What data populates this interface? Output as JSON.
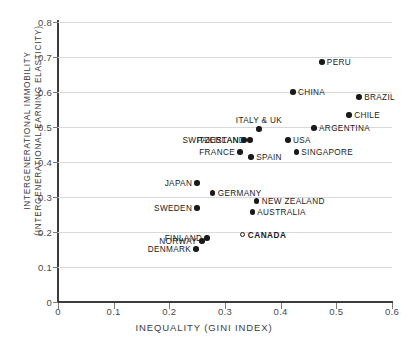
{
  "chart_data": {
    "type": "scatter",
    "title": "",
    "xlabel": "INEQUALITY (GINI INDEX)",
    "ylabel_line1": "INTERGENERATIONAL IMMOBILITY",
    "ylabel_line2": "(INTERGENERATIONAL EARNING ELASTICITY)",
    "xlim": [
      0,
      0.6
    ],
    "ylim": [
      0,
      0.8
    ],
    "xticks": [
      "0",
      "0.1",
      "0.2",
      "0.3",
      "0.4",
      "0.5",
      "0.6"
    ],
    "xtick_values": [
      0,
      0.1,
      0.2,
      0.3,
      0.4,
      0.5,
      0.6
    ],
    "yticks": [
      "0",
      "0.1",
      "0.2",
      "0.3",
      "0.4",
      "0.5",
      "0.6",
      "0.7",
      "0.8"
    ],
    "ytick_values": [
      0,
      0.1,
      0.2,
      0.3,
      0.4,
      0.5,
      0.6,
      0.7,
      0.8
    ],
    "grid": "horizontal",
    "legend": "none",
    "marker_color": "#1a1a1a",
    "points": [
      {
        "label": "PERU",
        "x": 0.474,
        "y": 0.686,
        "side": "right",
        "bold": false,
        "hollow": false
      },
      {
        "label": "CHINA",
        "x": 0.422,
        "y": 0.6,
        "side": "right",
        "bold": false,
        "hollow": false
      },
      {
        "label": "BRAZIL",
        "x": 0.541,
        "y": 0.586,
        "side": "right",
        "bold": false,
        "hollow": false
      },
      {
        "label": "CHILE",
        "x": 0.523,
        "y": 0.534,
        "side": "right",
        "bold": false,
        "hollow": false
      },
      {
        "label": "ARGENTINA",
        "x": 0.46,
        "y": 0.497,
        "side": "right",
        "bold": false,
        "hollow": false
      },
      {
        "label": "ITALY & UK",
        "x": 0.361,
        "y": 0.494,
        "side": "above",
        "bold": false,
        "hollow": false
      },
      {
        "label": "PAKISTAN",
        "x": 0.334,
        "y": 0.463,
        "side": "left",
        "bold": false,
        "hollow": false
      },
      {
        "label": "SWITZERLAND",
        "x": 0.345,
        "y": 0.463,
        "side": "left",
        "bold": false,
        "hollow": false
      },
      {
        "label": "USA",
        "x": 0.413,
        "y": 0.463,
        "side": "right",
        "bold": false,
        "hollow": false
      },
      {
        "label": "SINGAPORE",
        "x": 0.428,
        "y": 0.429,
        "side": "right",
        "bold": false,
        "hollow": false
      },
      {
        "label": "FRANCE",
        "x": 0.327,
        "y": 0.429,
        "side": "left",
        "bold": false,
        "hollow": false
      },
      {
        "label": "SPAIN",
        "x": 0.347,
        "y": 0.414,
        "side": "right",
        "bold": false,
        "hollow": false
      },
      {
        "label": "JAPAN",
        "x": 0.25,
        "y": 0.34,
        "side": "left",
        "bold": false,
        "hollow": false
      },
      {
        "label": "GERMANY",
        "x": 0.278,
        "y": 0.311,
        "side": "right",
        "bold": false,
        "hollow": false
      },
      {
        "label": "NEW ZEALAND",
        "x": 0.357,
        "y": 0.289,
        "side": "right",
        "bold": false,
        "hollow": false
      },
      {
        "label": "SWEDEN",
        "x": 0.25,
        "y": 0.269,
        "side": "left",
        "bold": false,
        "hollow": false
      },
      {
        "label": "AUSTRALIA",
        "x": 0.349,
        "y": 0.257,
        "side": "right",
        "bold": false,
        "hollow": false
      },
      {
        "label": "CANADA",
        "x": 0.332,
        "y": 0.191,
        "side": "right",
        "bold": true,
        "hollow": true
      },
      {
        "label": "FINLAND",
        "x": 0.268,
        "y": 0.183,
        "side": "left",
        "bold": false,
        "hollow": false
      },
      {
        "label": "NORWAY",
        "x": 0.259,
        "y": 0.174,
        "side": "left",
        "bold": false,
        "hollow": false
      },
      {
        "label": "DENMARK",
        "x": 0.248,
        "y": 0.151,
        "side": "left",
        "bold": false,
        "hollow": false
      }
    ]
  }
}
